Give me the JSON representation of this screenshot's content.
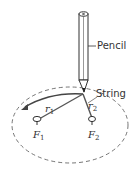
{
  "diagram": {
    "labels": {
      "pencil": "Pencil",
      "string": "String",
      "r1": "r",
      "r1_sub": "1",
      "r2": "r",
      "r2_sub": "2",
      "f1": "F",
      "f1_sub": "1",
      "f2": "F",
      "f2_sub": "2"
    },
    "colors": {
      "line": "#444444",
      "string": "#555555",
      "ellipse": "#666666"
    },
    "geometry": {
      "ellipse": {
        "cx": 70,
        "cy": 125,
        "rx": 58,
        "ry": 38
      },
      "pencil_tip": [
        83,
        94
      ],
      "focus_1": [
        37,
        120
      ],
      "focus_2": [
        92,
        121
      ]
    }
  }
}
